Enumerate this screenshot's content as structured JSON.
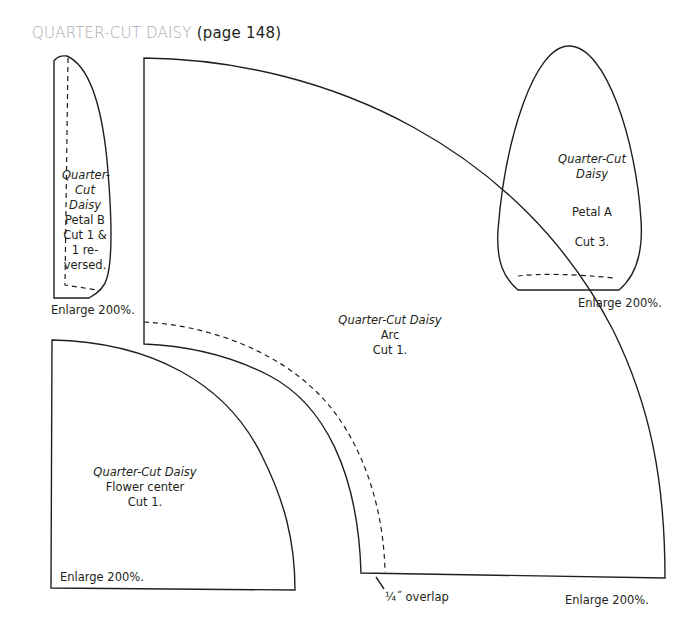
{
  "header": {
    "title": "QUARTER-CUT DAISY",
    "page_ref": "(page 148)"
  },
  "colors": {
    "title_gray": "#a7a9ac",
    "ink": "#231f20"
  },
  "pieces": {
    "petal_b": {
      "name_line1": "Quarter-",
      "name_line2": "Cut",
      "name_line3": "Daisy",
      "piece": "Petal B",
      "cut_line1": "Cut 1 &",
      "cut_line2": "1 re-",
      "cut_line3": "versed.",
      "enlarge": "Enlarge 200%."
    },
    "petal_a": {
      "name_line1": "Quarter-Cut",
      "name_line2": "Daisy",
      "piece": "Petal A",
      "cut": "Cut 3.",
      "enlarge": "Enlarge 200%."
    },
    "arc": {
      "name": "Quarter-Cut Daisy",
      "piece": "Arc",
      "cut": "Cut 1.",
      "enlarge": "Enlarge 200%.",
      "overlap_note": "¼˝ overlap"
    },
    "flower_center": {
      "name": "Quarter-Cut Daisy",
      "piece": "Flower center",
      "cut": "Cut 1.",
      "enlarge": "Enlarge 200%."
    }
  },
  "annotations": {
    "arc_left_enlarge": "Enlarge 200%."
  }
}
